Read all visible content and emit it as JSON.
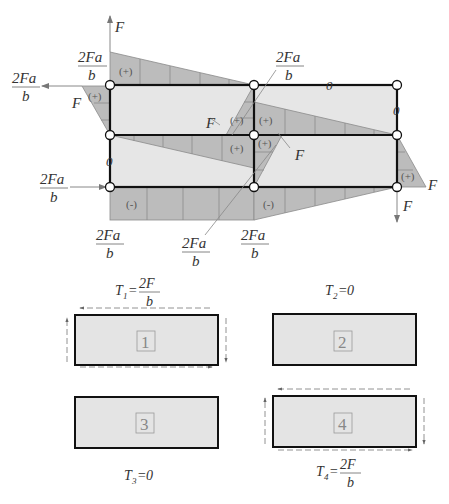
{
  "diagram": {
    "type": "closed-frame bending moment diagram with shear flows",
    "top": {
      "forces": [
        {
          "id": "F_top_up",
          "label": "F",
          "direction": "up",
          "at": "top-left node"
        },
        {
          "id": "M_left",
          "label_num": "2Fa",
          "label_den": "b",
          "direction": "left",
          "at": "top-left node"
        },
        {
          "id": "M_left_bottom",
          "label_num": "2Fa",
          "label_den": "b",
          "direction": "right",
          "at": "bottom-left node"
        },
        {
          "id": "F_right_down",
          "label": "F",
          "direction": "down",
          "at": "bottom-right node"
        }
      ],
      "moment_labels": {
        "top_left": {
          "num": "2Fa",
          "den": "b"
        },
        "top_center": {
          "num": "2Fa",
          "den": "b"
        },
        "left_outer": {
          "num": "2Fa",
          "den": "b"
        },
        "bottom_left_arrow": {
          "num": "2Fa",
          "den": "b"
        },
        "bottom_left": {
          "num": "2Fa",
          "den": "b"
        },
        "bottom_center_leader": {
          "num": "2Fa",
          "den": "b"
        },
        "bottom_center": {
          "num": "2Fa",
          "den": "b"
        }
      },
      "shear_labels": {
        "left_F": "F",
        "center_F_left": "F",
        "center_F_right": "F",
        "right_F": "F",
        "top_F": "F",
        "bottom_F": "F"
      },
      "zero_labels": [
        "0",
        "0",
        "0"
      ],
      "signs": {
        "plus": "(+)",
        "minus": "(-)"
      }
    },
    "cells": [
      {
        "number": "1",
        "T_label": "T",
        "T_sub": "1",
        "T_eq": "=",
        "T_num": "2F",
        "T_den": "b",
        "shear_flow": true
      },
      {
        "number": "2",
        "T_label": "T",
        "T_sub": "2",
        "T_eq": "=",
        "T_value": "0",
        "shear_flow": false
      },
      {
        "number": "3",
        "T_label": "T",
        "T_sub": "3",
        "T_eq": "=",
        "T_value": "0",
        "shear_flow": false
      },
      {
        "number": "4",
        "T_label": "T",
        "T_sub": "4",
        "T_eq": "=",
        "T_num": "2F",
        "T_den": "b",
        "shear_flow": true
      }
    ],
    "colors": {
      "frame": "#111111",
      "diagram_fill": "#bcbcbc",
      "panel_fill": "#e6e6e6",
      "grid_line": "#8a8a8a",
      "text": "#333333",
      "arrow": "#888888"
    }
  }
}
